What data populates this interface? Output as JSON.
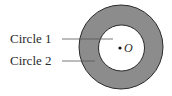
{
  "diagram": {
    "labels": {
      "circle1": "Circle 1",
      "circle2": "Circle 2",
      "center": "O"
    },
    "colors": {
      "ring_fill": "#8c8c8c",
      "ring_stroke": "#2a2a2a",
      "inner_fill": "#ffffff",
      "leader_line": "#555555"
    },
    "geometry": {
      "center": [
        121,
        47
      ],
      "outer_radius": 42,
      "inner_radius": 23
    }
  }
}
